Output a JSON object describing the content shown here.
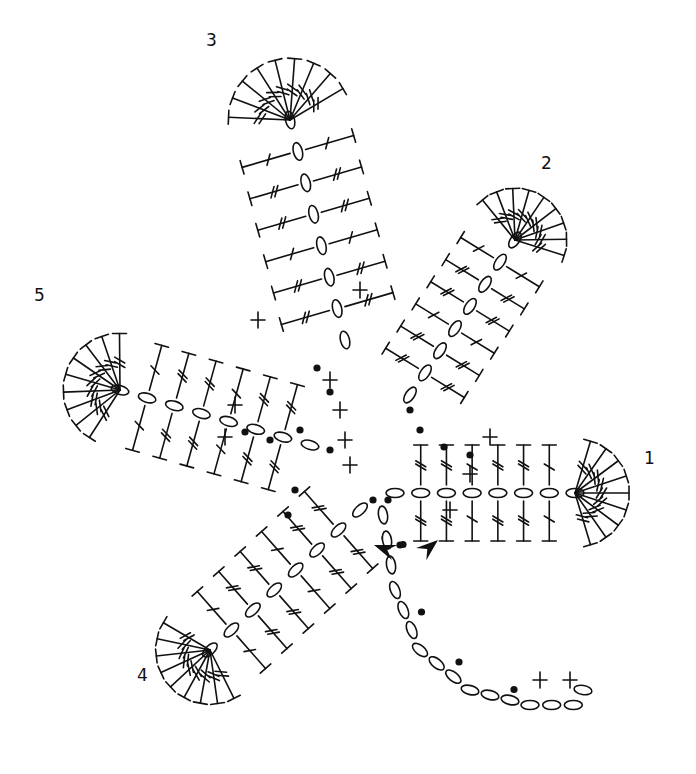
{
  "diagram": {
    "type": "crochet-chart",
    "colors": {
      "ink": "#111111",
      "background": "#ffffff"
    },
    "labels": [
      {
        "text": "3",
        "x": 213,
        "y": 30
      },
      {
        "text": "2",
        "x": 548,
        "y": 153
      },
      {
        "text": "5",
        "x": 41,
        "y": 285
      },
      {
        "text": "1",
        "x": 646,
        "y": 448
      },
      {
        "text": "4",
        "x": 140,
        "y": 665
      }
    ],
    "start_markers": [
      {
        "x": 374,
        "y": 545,
        "angle": -160
      },
      {
        "x": 438,
        "y": 540,
        "angle": -40
      }
    ],
    "leaves": [
      {
        "name": "leaf-1",
        "cx": 520,
        "cy": 460,
        "angle": 0,
        "len": 150,
        "w": 100,
        "spine": [
          [
            395,
            493
          ],
          [
            575,
            493
          ]
        ]
      },
      {
        "name": "leaf-2",
        "cx": 470,
        "cy": 285,
        "angle": -50,
        "len": 150,
        "w": 95,
        "spine": [
          [
            410,
            395
          ],
          [
            515,
            240
          ]
        ]
      },
      {
        "name": "leaf-3",
        "cx": 275,
        "cy": 200,
        "angle": -90,
        "len": 190,
        "w": 115,
        "spine": [
          [
            345,
            340
          ],
          [
            290,
            120
          ]
        ]
      },
      {
        "name": "leaf-5",
        "cx": 180,
        "cy": 360,
        "angle": 190,
        "len": 150,
        "w": 105,
        "spine": [
          [
            310,
            445
          ],
          [
            120,
            390
          ]
        ]
      },
      {
        "name": "leaf-4",
        "cx": 240,
        "cy": 600,
        "angle": 150,
        "len": 130,
        "w": 100,
        "spine": [
          [
            360,
            510
          ],
          [
            210,
            650
          ]
        ]
      }
    ],
    "stem": {
      "points": [
        [
          383,
          515
        ],
        [
          395,
          590
        ],
        [
          420,
          650
        ],
        [
          470,
          690
        ],
        [
          530,
          705
        ],
        [
          595,
          705
        ]
      ]
    },
    "legend": {
      "chain": "oval",
      "slip_stitch": "dot",
      "single_crochet": "cross",
      "half_double": "T",
      "double_crochet": "T-one-slash",
      "treble": "T-two-slash"
    }
  }
}
